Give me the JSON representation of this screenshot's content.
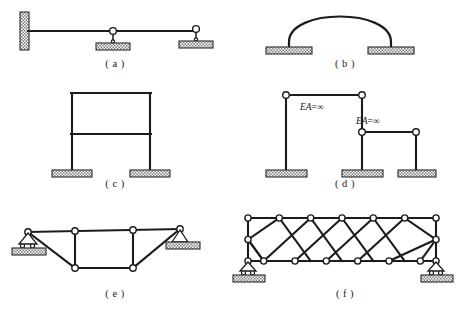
{
  "figure": {
    "background_color": "#ffffff",
    "line_color": "#1c1c1c",
    "hatch_color": "#8a8a8a"
  },
  "panels": [
    {
      "id": "a",
      "caption": "( a )",
      "type": "continuous-beam",
      "description": "Horizontal beam fixed at left wall with two hinged supports",
      "supports": [
        "fixed-wall",
        "hinge-on-base",
        "hinge-on-base"
      ],
      "nodes": 2
    },
    {
      "id": "b",
      "caption": "( b )",
      "type": "arch",
      "description": "Semicircular arch on two fixed bases",
      "supports": [
        "fixed-base",
        "fixed-base"
      ],
      "nodes": 0
    },
    {
      "id": "c",
      "caption": "( c )",
      "type": "rigid-frame",
      "description": "Two-story rigid portal frame with two fixed column bases",
      "supports": [
        "fixed-base",
        "fixed-base"
      ],
      "nodes": 0
    },
    {
      "id": "d",
      "caption": "( d )",
      "type": "columns-with-rigid-links",
      "description": "Three columns connected by axially rigid horizontal links",
      "supports": [
        "fixed-base",
        "fixed-base",
        "fixed-base"
      ],
      "labels": [
        "EA=∞",
        "EA=∞"
      ],
      "nodes": 4
    },
    {
      "id": "e",
      "caption": "( e )",
      "type": "trapezoidal-truss",
      "description": "Trapezoidal truss, roller support left and pin support right",
      "supports": [
        "roller",
        "pin"
      ],
      "nodes": 6
    },
    {
      "id": "f",
      "caption": "( f )",
      "type": "cross-braced-truss",
      "description": "Rectangular parallel-chord truss with X cross bracing, roller supports both ends",
      "supports": [
        "roller",
        "roller"
      ],
      "panels_count": 6,
      "nodes": 16
    }
  ],
  "labels": {
    "ea_infinity_prefix": "EA",
    "ea_infinity_equals": "=∞"
  }
}
